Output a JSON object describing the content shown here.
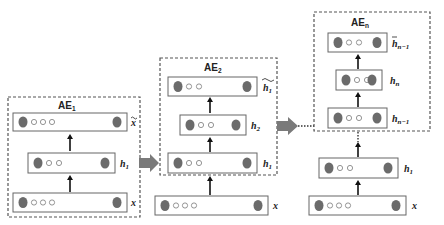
{
  "diagram": {
    "autoencoders": [
      {
        "id": "ae1",
        "label": "AE",
        "subscript": "1",
        "layers": [
          {
            "id": "x",
            "label": "x",
            "subscript": "",
            "tilde": false,
            "small_nodes": 3
          },
          {
            "id": "h1",
            "label": "h",
            "subscript": "1",
            "tilde": false,
            "small_nodes": 2
          },
          {
            "id": "x-recon",
            "label": "x",
            "subscript": "",
            "tilde": true,
            "small_nodes": 3
          }
        ]
      },
      {
        "id": "ae2",
        "label": "AE",
        "subscript": "2",
        "input_outside": {
          "id": "x",
          "label": "x",
          "subscript": "",
          "tilde": false,
          "small_nodes": 3
        },
        "layers": [
          {
            "id": "h1",
            "label": "h",
            "subscript": "1",
            "tilde": false,
            "small_nodes": 2
          },
          {
            "id": "h2",
            "label": "h",
            "subscript": "2",
            "tilde": false,
            "small_nodes": 2
          },
          {
            "id": "h1-recon",
            "label": "h",
            "subscript": "1",
            "tilde": true,
            "small_nodes": 2
          }
        ]
      },
      {
        "id": "aen",
        "label": "AE",
        "subscript": "n",
        "inputs_outside": [
          {
            "id": "x",
            "label": "x",
            "subscript": "",
            "tilde": false,
            "small_nodes": 3
          },
          {
            "id": "h1",
            "label": "h",
            "subscript": "1",
            "tilde": false,
            "small_nodes": 2
          }
        ],
        "layers": [
          {
            "id": "hn-1",
            "label": "h",
            "subscript": "n−1",
            "tilde": false,
            "small_nodes": 2
          },
          {
            "id": "hn",
            "label": "h",
            "subscript": "n",
            "tilde": false,
            "small_nodes": 2
          },
          {
            "id": "hn-1-recon",
            "label": "h",
            "subscript": "n−1",
            "tilde": true,
            "small_nodes": 2
          }
        ]
      }
    ],
    "colors": {
      "big_node": "#6b6b6b",
      "transfer_arrow": "#7a7a7a",
      "box_border": "#555555"
    }
  }
}
